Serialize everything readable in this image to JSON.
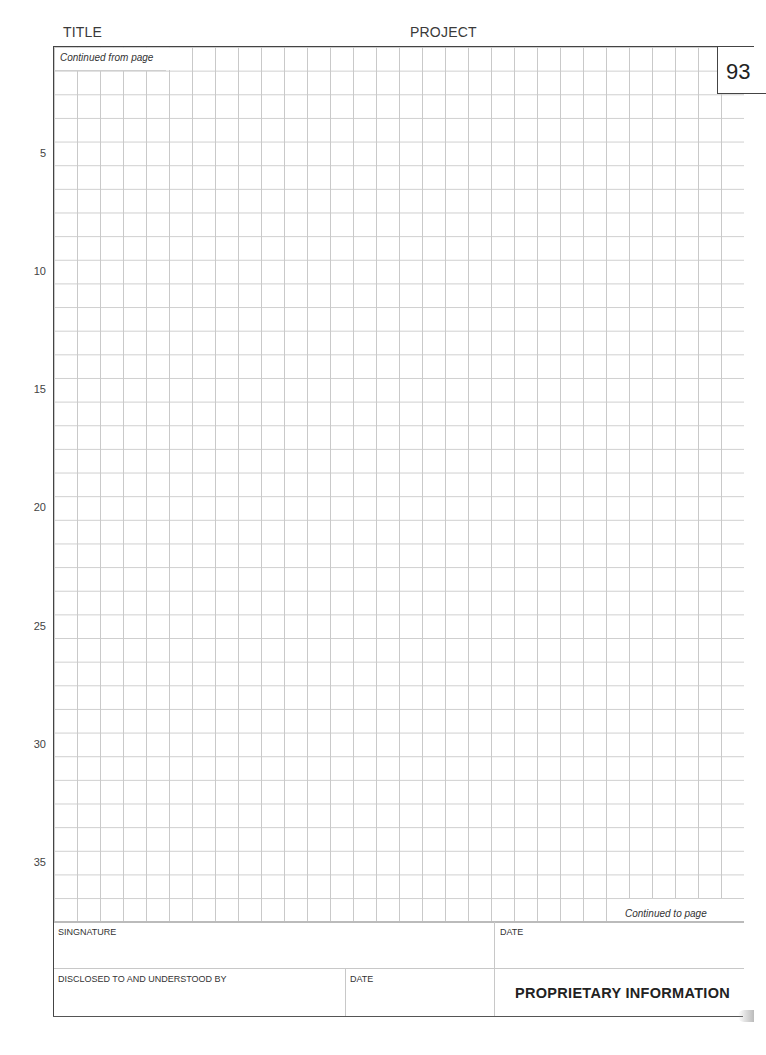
{
  "header": {
    "title_label": "TITLE",
    "project_label": "PROJECT"
  },
  "page": {
    "number": "93",
    "continued_from_label": "Continued from page",
    "continued_to_label": "Continued to page"
  },
  "grid": {
    "rows": 37,
    "row_labels": [
      {
        "label": "5",
        "row": 5
      },
      {
        "label": "10",
        "row": 10
      },
      {
        "label": "15",
        "row": 15
      },
      {
        "label": "20",
        "row": 20
      },
      {
        "label": "25",
        "row": 25
      },
      {
        "label": "30",
        "row": 30
      },
      {
        "label": "35",
        "row": 35
      }
    ]
  },
  "footer": {
    "signature_label": "SINGNATURE",
    "signature_date_label": "DATE",
    "disclosed_label": "DISCLOSED TO AND UNDERSTOOD BY",
    "disclosed_date_label": "DATE",
    "proprietary_label": "PROPRIETARY INFORMATION"
  }
}
